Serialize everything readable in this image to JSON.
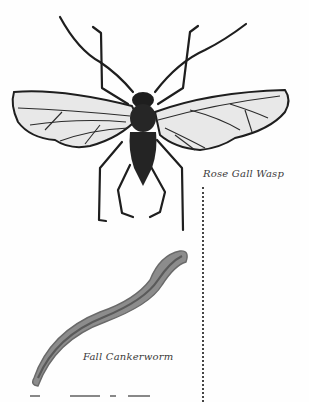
{
  "captions": {
    "wasp": "Rose Gall Wasp",
    "worm": "Fall Cankerworm"
  },
  "illustrations": [
    {
      "name": "rose-gall-wasp",
      "style": "ink drawing, grayscale"
    },
    {
      "name": "fall-cankerworm",
      "style": "gray wash drawing"
    }
  ],
  "colors": {
    "ink": "#1e1e1e",
    "wing_fill": "#e6e6e6",
    "worm_fill": "#8a8a8a",
    "worm_stripe": "#5e5e5e",
    "caption": "#3a3a3a",
    "background": "#fefefe"
  }
}
